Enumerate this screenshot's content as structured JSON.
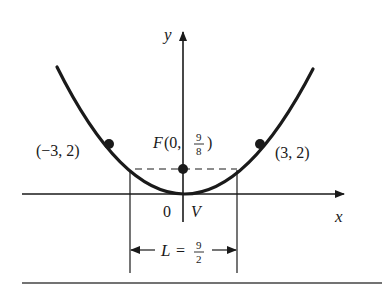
{
  "diagram": {
    "type": "parabola",
    "equation_hint": "y = (2/9) x^2",
    "axes": {
      "x_label": "x",
      "y_label": "y"
    },
    "points": [
      {
        "label": "(−3, 2)",
        "x": -3,
        "y": 2
      },
      {
        "label": "(3, 2)",
        "x": 3,
        "y": 2
      }
    ],
    "focus": {
      "prefix": "F(0, ",
      "num": "9",
      "den": "8",
      "suffix": ")"
    },
    "origin_label": "0",
    "vertex_label": "V",
    "latus_rectum": {
      "prefix": "L =",
      "num": "9",
      "den": "2"
    }
  }
}
